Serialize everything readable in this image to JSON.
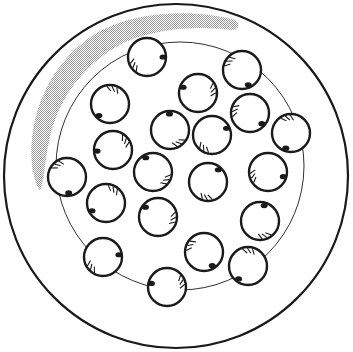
{
  "diagram": {
    "colors": {
      "stroke": "#1a1a1a",
      "shade": "#b8b8b8",
      "background": "#ffffff"
    },
    "dish": {
      "cx": 176,
      "cy": 176,
      "r": 172
    },
    "inner_ring": {
      "cx": 180,
      "cy": 166,
      "r": 124
    },
    "cells": [
      {
        "x": 147,
        "y": 57
      },
      {
        "x": 242,
        "y": 70
      },
      {
        "x": 110,
        "y": 104
      },
      {
        "x": 198,
        "y": 93
      },
      {
        "x": 170,
        "y": 130
      },
      {
        "x": 212,
        "y": 135
      },
      {
        "x": 250,
        "y": 113
      },
      {
        "x": 291,
        "y": 133
      },
      {
        "x": 113,
        "y": 150
      },
      {
        "x": 153,
        "y": 172
      },
      {
        "x": 208,
        "y": 182
      },
      {
        "x": 268,
        "y": 172
      },
      {
        "x": 67,
        "y": 177
      },
      {
        "x": 106,
        "y": 203
      },
      {
        "x": 158,
        "y": 217
      },
      {
        "x": 260,
        "y": 221
      },
      {
        "x": 103,
        "y": 257
      },
      {
        "x": 204,
        "y": 252
      },
      {
        "x": 248,
        "y": 266
      },
      {
        "x": 167,
        "y": 287
      }
    ],
    "cell_radius": 19
  }
}
